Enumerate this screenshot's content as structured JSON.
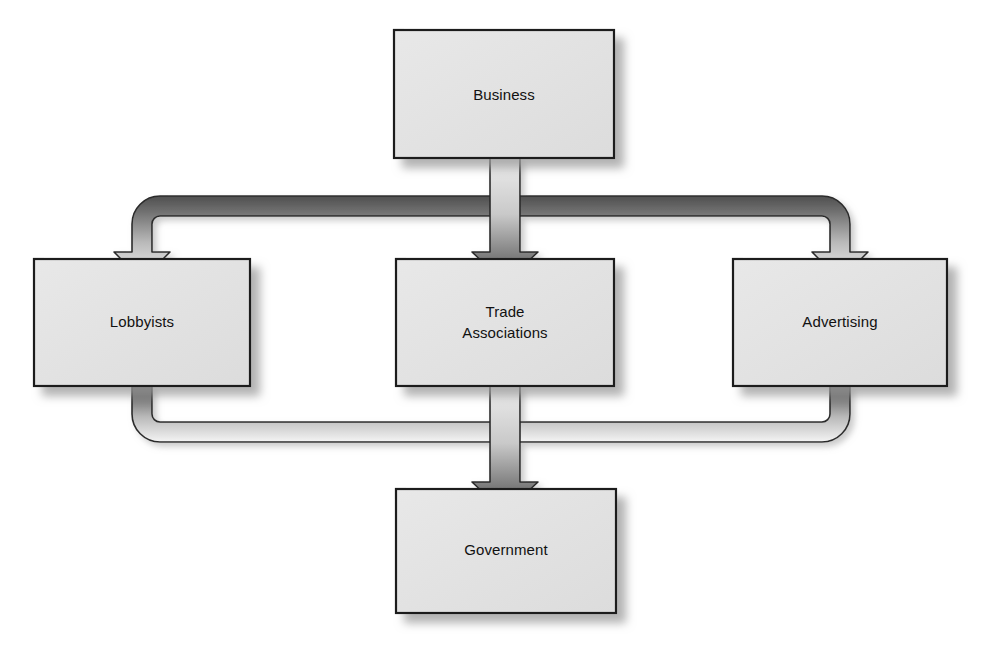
{
  "diagram": {
    "type": "flow-diagram",
    "background_color": "#ffffff",
    "node_fill_color": "#e3e3e3",
    "node_border_color": "#1a1a1a",
    "node_shadow_color": "#b5b5b5",
    "arrow_dark_color": "#4a4a4a",
    "arrow_light_color": "#f2f2f2",
    "arrow_outline_color": "#2b2b2b",
    "nodes": [
      {
        "id": "business",
        "label": "Business",
        "lines": [
          "Business"
        ],
        "x": 394,
        "y": 30,
        "width": 220,
        "height": 128
      },
      {
        "id": "lobbyists",
        "label": "Lobbyists",
        "lines": [
          "Lobbyists"
        ],
        "x": 34,
        "y": 259,
        "width": 216,
        "height": 127
      },
      {
        "id": "trade-associations",
        "label": "Trade Associations",
        "lines": [
          "Trade",
          "Associations"
        ],
        "x": 396,
        "y": 259,
        "width": 218,
        "height": 127
      },
      {
        "id": "advertising",
        "label": "Advertising",
        "lines": [
          "Advertising"
        ],
        "x": 733,
        "y": 259,
        "width": 214,
        "height": 127
      },
      {
        "id": "government",
        "label": "Government",
        "lines": [
          "Government"
        ],
        "x": 396,
        "y": 489,
        "width": 220,
        "height": 124
      }
    ],
    "connections": [
      {
        "id": "business-to-lobbyists",
        "from": "business",
        "to": "lobbyists",
        "style": "elbow-ribbon",
        "direction": "down-left"
      },
      {
        "id": "business-to-trade-associations",
        "from": "business",
        "to": "trade-associations",
        "style": "straight-ribbon",
        "direction": "down"
      },
      {
        "id": "business-to-advertising",
        "from": "business",
        "to": "advertising",
        "style": "elbow-ribbon",
        "direction": "down-right"
      },
      {
        "id": "lobbyists-to-government",
        "from": "lobbyists",
        "to": "government",
        "style": "elbow-ribbon",
        "direction": "down-right"
      },
      {
        "id": "trade-associations-to-government",
        "from": "trade-associations",
        "to": "government",
        "style": "straight-ribbon",
        "direction": "down"
      },
      {
        "id": "advertising-to-government",
        "from": "advertising",
        "to": "government",
        "style": "elbow-ribbon",
        "direction": "down-left"
      }
    ]
  }
}
